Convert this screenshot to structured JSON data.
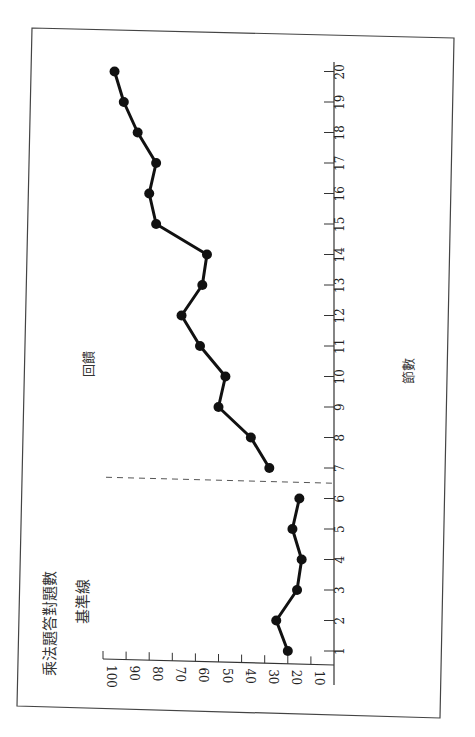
{
  "chart_data": {
    "type": "line",
    "orientation": "rotated-90-ccw",
    "title": "乘法題答對題數",
    "xlabel": "節數",
    "ylabel": "乘法題答對題數",
    "phase_labels": [
      {
        "label": "基準線",
        "sessions": [
          1,
          6
        ]
      },
      {
        "label": "回饋",
        "sessions": [
          7,
          20
        ]
      }
    ],
    "phase_change_after_session": 6.5,
    "x": [
      1,
      2,
      3,
      4,
      5,
      6,
      7,
      8,
      9,
      10,
      11,
      12,
      13,
      14,
      15,
      16,
      17,
      18,
      19,
      20
    ],
    "x_ticks": [
      "1",
      "2",
      "3",
      "4",
      "5",
      "6",
      "7",
      "8",
      "9",
      "10",
      "11",
      "12",
      "13",
      "14",
      "15",
      "16",
      "17",
      "18",
      "19",
      "20"
    ],
    "y_ticks": [
      "10",
      "20",
      "30",
      "40",
      "50",
      "60",
      "70",
      "80",
      "90",
      "100"
    ],
    "ylim": [
      0,
      100
    ],
    "xlim": [
      0,
      20
    ],
    "grid": false,
    "legend": null,
    "series": [
      {
        "name": "基準線",
        "x": [
          1,
          2,
          3,
          4,
          5,
          6
        ],
        "values": [
          20,
          25,
          16,
          14,
          18,
          15
        ]
      },
      {
        "name": "回饋",
        "x": [
          7,
          8,
          9,
          10,
          11,
          12,
          13,
          14,
          15,
          16,
          17,
          18,
          19,
          20
        ],
        "values": [
          28,
          36,
          50,
          47,
          58,
          66,
          57,
          55,
          77,
          80,
          77,
          85,
          91,
          95
        ]
      }
    ]
  },
  "labels": {
    "y_axis_title": "乘法題答對題數",
    "baseline_phase": "基準線",
    "feedback_phase": "回饋",
    "x_axis_title": "節數"
  }
}
